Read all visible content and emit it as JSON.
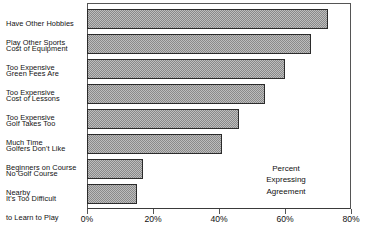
{
  "chart_data": {
    "type": "bar",
    "orientation": "horizontal",
    "title": "",
    "subtitle": "",
    "xlabel": "",
    "ylabel": "",
    "xlim": [
      0,
      80
    ],
    "grid": false,
    "legend": null,
    "annotations": [
      {
        "name": "percent-expressing-agreement",
        "lines": [
          "Percent",
          "Expressing",
          "Agreement"
        ],
        "text": "Percent Expressing Agreement"
      }
    ],
    "xticks": [
      0,
      20,
      40,
      60,
      80
    ],
    "xticklabels": [
      "0%",
      "20%",
      "40%",
      "60%",
      "80%"
    ],
    "categories": [
      "Have Other Hobbies\nPlay Other Sports",
      "Cost of Equipment\nToo Expensive",
      "Green Fees Are\nToo Expensive",
      "Cost of Lessons\nToo Expensive",
      "Golf Takes Too\nMuch Time",
      "Golfers Don't Like\nBeginners on Course",
      "No Golf Course\nNearby",
      "It's Too Difficult\nto Learn to Play"
    ],
    "values": [
      73,
      68,
      60,
      54,
      46,
      41,
      17,
      15
    ],
    "bar_fill": "#bdbdbd",
    "bar_pattern": "checkerboard-dither",
    "bar_edge_color": "#2b2b2b",
    "axis_color": "#555555",
    "background": "#ffffff"
  },
  "labels": {
    "items": [
      {
        "line1": "Have Other Hobbies",
        "line2": "Play Other Sports"
      },
      {
        "line1": "Cost of Equipment",
        "line2": "Too Expensive"
      },
      {
        "line1": "Green Fees Are",
        "line2": "Too Expensive"
      },
      {
        "line1": "Cost of Lessons",
        "line2": "Too Expensive"
      },
      {
        "line1": "Golf Takes Too",
        "line2": "Much Time"
      },
      {
        "line1": "Golfers Don't Like",
        "line2": "Beginners on Course"
      },
      {
        "line1": "No Golf Course",
        "line2": "Nearby"
      },
      {
        "line1": "It's Too Difficult",
        "line2": "to Learn to Play"
      }
    ]
  },
  "annotation": {
    "line1": "Percent",
    "line2": "Expressing",
    "line3": "Agreement"
  },
  "axis": {
    "tick_labels": [
      "0%",
      "20%",
      "40%",
      "60%",
      "80%"
    ]
  }
}
